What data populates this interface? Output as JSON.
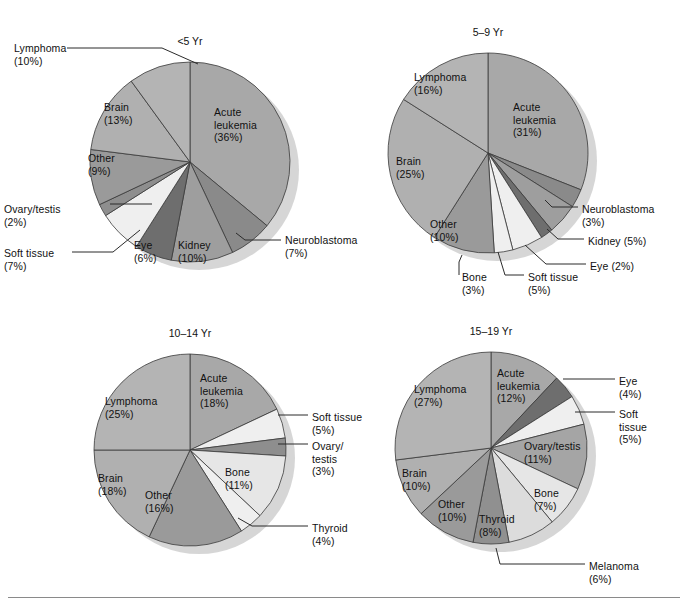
{
  "figure": {
    "background": "#ffffff",
    "text_color": "#111111",
    "leader_line_color": "#2b2b2b",
    "slice_edge_color": "#3a3a3a",
    "shadow_color": "#cfcfcf",
    "palette": {
      "acute_leukemia": "#a8a8a8",
      "lymphoma": "#b4b4b4",
      "brain": "#b0b0b0",
      "other": "#9a9a9a",
      "bone": "#e6e6e6",
      "soft_tissue": "#efefef",
      "ovary_testis": "#8e8e8e",
      "kidney": "#9e9e9e",
      "eye": "#6e6e6e",
      "neuroblastoma": "#8a8a8a",
      "thyroid": "#dcdcdc",
      "melanoma": "#909090"
    },
    "footer_rule": true
  },
  "chart_data": [
    {
      "type": "pie",
      "title": "<5 Yr",
      "id": "under-5",
      "center": [
        190,
        162
      ],
      "radius": 100,
      "start_angle": 0,
      "categories": [
        "Acute leukemia",
        "Neuroblastoma",
        "Kidney",
        "Eye",
        "Soft tissue",
        "Ovary/testis",
        "Other",
        "Brain",
        "Lymphoma"
      ],
      "values": [
        36,
        7,
        10,
        6,
        7,
        2,
        9,
        13,
        10
      ],
      "colors": [
        "#a8a8a8",
        "#8a8a8a",
        "#9e9e9e",
        "#6e6e6e",
        "#efefef",
        "#8e8e8e",
        "#9a9a9a",
        "#b0b0b0",
        "#b4b4b4"
      ],
      "labels": [
        {
          "text": "Acute\nleukemia\n(36%)",
          "x": 214,
          "y": 106,
          "align": "left",
          "inside": true
        },
        {
          "text": "Neuroblastoma\n(7%)",
          "x": 285,
          "y": 234,
          "align": "left",
          "inside": false
        },
        {
          "text": "Kidney\n(10%)",
          "x": 178,
          "y": 239,
          "align": "left",
          "inside": true
        },
        {
          "text": "Eye\n(6%)",
          "x": 134,
          "y": 239,
          "align": "left",
          "inside": true
        },
        {
          "text": "Soft tissue\n(7%)",
          "x": 4,
          "y": 247,
          "align": "left",
          "inside": false
        },
        {
          "text": "Ovary/testis\n(2%)",
          "x": 4,
          "y": 203,
          "align": "left",
          "inside": false
        },
        {
          "text": "Other\n(9%)",
          "x": 88,
          "y": 152,
          "align": "left",
          "inside": true
        },
        {
          "text": "Brain\n(13%)",
          "x": 104,
          "y": 101,
          "align": "left",
          "inside": true
        },
        {
          "text": "Lymphoma\n(10%)",
          "x": 14,
          "y": 42,
          "align": "left",
          "inside": false
        }
      ]
    },
    {
      "type": "pie",
      "title": "5–9 Yr",
      "id": "5-9",
      "center": [
        488,
        153
      ],
      "radius": 100,
      "start_angle": 0,
      "categories": [
        "Acute leukemia",
        "Neuroblastoma",
        "Kidney",
        "Eye",
        "Soft tissue",
        "Bone",
        "Other",
        "Brain",
        "Lymphoma"
      ],
      "values": [
        31,
        3,
        5,
        2,
        5,
        3,
        10,
        25,
        16
      ],
      "colors": [
        "#a8a8a8",
        "#8a8a8a",
        "#9e9e9e",
        "#6e6e6e",
        "#efefef",
        "#efefef",
        "#9a9a9a",
        "#b0b0b0",
        "#b4b4b4"
      ],
      "labels": [
        {
          "text": "Acute\nleukemia\n(31%)",
          "x": 513,
          "y": 101,
          "align": "left",
          "inside": true
        },
        {
          "text": "Neuroblastoma\n(3%)",
          "x": 582,
          "y": 203,
          "align": "left",
          "inside": false
        },
        {
          "text": "Kidney (5%)",
          "x": 588,
          "y": 235,
          "align": "left",
          "inside": false
        },
        {
          "text": "Eye (2%)",
          "x": 590,
          "y": 260,
          "align": "left",
          "inside": false
        },
        {
          "text": "Soft tissue\n(5%)",
          "x": 528,
          "y": 271,
          "align": "left",
          "inside": false
        },
        {
          "text": "Bone\n(3%)",
          "x": 462,
          "y": 271,
          "align": "left",
          "inside": false
        },
        {
          "text": "Other\n(10%)",
          "x": 430,
          "y": 218,
          "align": "left",
          "inside": true
        },
        {
          "text": "Brain\n(25%)",
          "x": 396,
          "y": 155,
          "align": "left",
          "inside": true
        },
        {
          "text": "Lymphoma\n(16%)",
          "x": 414,
          "y": 71,
          "align": "left",
          "inside": true
        }
      ]
    },
    {
      "type": "pie",
      "title": "10–14 Yr",
      "id": "10-14",
      "center": [
        190,
        450
      ],
      "radius": 96,
      "start_angle": 0,
      "categories": [
        "Acute leukemia",
        "Soft tissue",
        "Ovary/testis",
        "Bone",
        "Thyroid",
        "Other",
        "Brain",
        "Lymphoma"
      ],
      "values": [
        18,
        5,
        3,
        11,
        4,
        16,
        18,
        25
      ],
      "colors": [
        "#a8a8a8",
        "#efefef",
        "#8e8e8e",
        "#e6e6e6",
        "#efefef",
        "#9a9a9a",
        "#b0b0b0",
        "#b4b4b4"
      ],
      "labels": [
        {
          "text": "Acute\nleukemia\n(18%)",
          "x": 200,
          "y": 372,
          "align": "left",
          "inside": true
        },
        {
          "text": "Soft tissue\n(5%)",
          "x": 312,
          "y": 411,
          "align": "left",
          "inside": false
        },
        {
          "text": "Ovary/\ntestis\n(3%)",
          "x": 312,
          "y": 440,
          "align": "left",
          "inside": false
        },
        {
          "text": "Bone\n(11%)",
          "x": 225,
          "y": 466,
          "align": "left",
          "inside": true
        },
        {
          "text": "Thyroid\n(4%)",
          "x": 312,
          "y": 522,
          "align": "left",
          "inside": false
        },
        {
          "text": "Other\n(16%)",
          "x": 145,
          "y": 489,
          "align": "left",
          "inside": true
        },
        {
          "text": "Brain\n(18%)",
          "x": 98,
          "y": 472,
          "align": "left",
          "inside": true
        },
        {
          "text": "Lymphoma\n(25%)",
          "x": 105,
          "y": 395,
          "align": "left",
          "inside": true
        }
      ]
    },
    {
      "type": "pie",
      "title": "15–19 Yr",
      "id": "15-19",
      "center": [
        491,
        448
      ],
      "radius": 96,
      "start_angle": 0,
      "categories": [
        "Acute leukemia",
        "Eye",
        "Soft tissue",
        "Ovary/testis",
        "Bone",
        "Thyroid",
        "Melanoma",
        "Other",
        "Brain",
        "Lymphoma"
      ],
      "values": [
        12,
        4,
        5,
        11,
        7,
        8,
        6,
        10,
        10,
        27
      ],
      "colors": [
        "#a8a8a8",
        "#6e6e6e",
        "#efefef",
        "#a5a5a5",
        "#e6e6e6",
        "#dcdcdc",
        "#909090",
        "#9a9a9a",
        "#b0b0b0",
        "#b4b4b4"
      ],
      "labels": [
        {
          "text": "Acute\nleukemia\n(12%)",
          "x": 497,
          "y": 367,
          "align": "left",
          "inside": true
        },
        {
          "text": "Eye\n(4%)",
          "x": 619,
          "y": 375,
          "align": "left",
          "inside": false
        },
        {
          "text": "Soft\ntissue\n(5%)",
          "x": 619,
          "y": 408,
          "align": "left",
          "inside": false
        },
        {
          "text": "Ovary/testis\n(11%)",
          "x": 524,
          "y": 440,
          "align": "left",
          "inside": true
        },
        {
          "text": "Bone\n(7%)",
          "x": 534,
          "y": 487,
          "align": "left",
          "inside": true
        },
        {
          "text": "Thyroid\n(8%)",
          "x": 479,
          "y": 513,
          "align": "left",
          "inside": true
        },
        {
          "text": "Melanoma\n(6%)",
          "x": 589,
          "y": 560,
          "align": "left",
          "inside": false
        },
        {
          "text": "Other\n(10%)",
          "x": 438,
          "y": 498,
          "align": "left",
          "inside": true
        },
        {
          "text": "Brain\n(10%)",
          "x": 402,
          "y": 467,
          "align": "left",
          "inside": true
        },
        {
          "text": "Lymphoma\n(27%)",
          "x": 414,
          "y": 383,
          "align": "left",
          "inside": true
        }
      ]
    }
  ],
  "leaders": [
    {
      "chart": "under-5",
      "points": [
        [
          67,
          48
        ],
        [
          162,
          48
        ],
        [
          198,
          64
        ]
      ]
    },
    {
      "chart": "under-5",
      "points": [
        [
          110,
          204
        ],
        [
          152,
          204
        ]
      ]
    },
    {
      "chart": "under-5",
      "points": [
        [
          72,
          252
        ],
        [
          113,
          252
        ],
        [
          140,
          230
        ]
      ]
    },
    {
      "chart": "under-5",
      "points": [
        [
          281,
          240
        ],
        [
          245,
          240
        ],
        [
          236,
          233
        ]
      ]
    },
    {
      "chart": "5-9",
      "points": [
        [
          578,
          207
        ],
        [
          552,
          207
        ],
        [
          545,
          200
        ]
      ]
    },
    {
      "chart": "5-9",
      "points": [
        [
          584,
          239
        ],
        [
          558,
          239
        ],
        [
          547,
          229
        ]
      ]
    },
    {
      "chart": "5-9",
      "points": [
        [
          586,
          264
        ],
        [
          546,
          264
        ],
        [
          525,
          245
        ]
      ]
    },
    {
      "chart": "5-9",
      "points": [
        [
          524,
          275
        ],
        [
          505,
          275
        ],
        [
          498,
          252
        ]
      ]
    },
    {
      "chart": "5-9",
      "points": [
        [
          459,
          275
        ],
        [
          459,
          262
        ],
        [
          462,
          255
        ]
      ]
    },
    {
      "chart": "10-14",
      "points": [
        [
          308,
          415
        ],
        [
          278,
          415
        ]
      ]
    },
    {
      "chart": "10-14",
      "points": [
        [
          308,
          444
        ],
        [
          278,
          444
        ]
      ]
    },
    {
      "chart": "10-14",
      "points": [
        [
          308,
          526
        ],
        [
          252,
          526
        ],
        [
          238,
          518
        ]
      ]
    },
    {
      "chart": "15-19",
      "points": [
        [
          615,
          379
        ],
        [
          563,
          379
        ]
      ]
    },
    {
      "chart": "15-19",
      "points": [
        [
          615,
          412
        ],
        [
          575,
          412
        ]
      ]
    },
    {
      "chart": "15-19",
      "points": [
        [
          585,
          564
        ],
        [
          500,
          564
        ],
        [
          496,
          548
        ]
      ]
    }
  ]
}
